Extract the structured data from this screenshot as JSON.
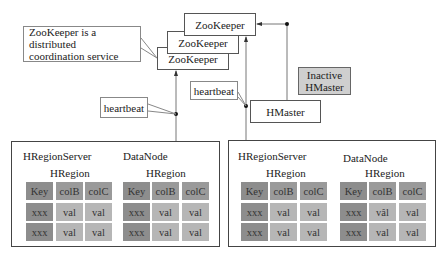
{
  "zookeeper": {
    "instances": [
      "ZooKeeper",
      "ZooKeeper",
      "ZooKeeper"
    ],
    "callout": [
      "ZooKeeper is a distributed",
      "coordination service"
    ]
  },
  "heartbeat_left": "heartbeat",
  "heartbeat_right": "heartbeat",
  "hmaster": "HMaster",
  "inactive_hmaster": [
    "Inactive",
    "HMaster"
  ],
  "colors": {
    "key_cell": "#8d8d8d",
    "header_cell": "#9a9a9a",
    "val_cell": "#b6b6b6",
    "inactive_bg": "#cfcfcf"
  },
  "servers": [
    {
      "server_label": "HRegionServer",
      "datanode_label": "DataNode",
      "regions": [
        {
          "label": "HRegion",
          "header": [
            "Key",
            "colB",
            "colC"
          ],
          "rows": [
            [
              "xxx",
              "val",
              "val"
            ],
            [
              "xxx",
              "val",
              "val"
            ]
          ]
        },
        {
          "label": "HRegion",
          "header": [
            "Key",
            "colB",
            "colC"
          ],
          "rows": [
            [
              "xxx",
              "val",
              "val"
            ],
            [
              "xxx",
              "val",
              "val"
            ]
          ]
        }
      ]
    },
    {
      "server_label": "HRegionServer",
      "datanode_label": "DataNode",
      "regions": [
        {
          "label": "HRegion",
          "header": [
            "Key",
            "colB",
            "colC"
          ],
          "rows": [
            [
              "xxx",
              "val",
              "val"
            ],
            [
              "xxx",
              "val",
              "val"
            ]
          ]
        },
        {
          "label": "HRegion",
          "header": [
            "Key",
            "colB",
            "colC"
          ],
          "rows": [
            [
              "xxx",
              "vâl",
              "val"
            ],
            [
              "xxx",
              "val",
              "val"
            ]
          ]
        }
      ]
    }
  ]
}
